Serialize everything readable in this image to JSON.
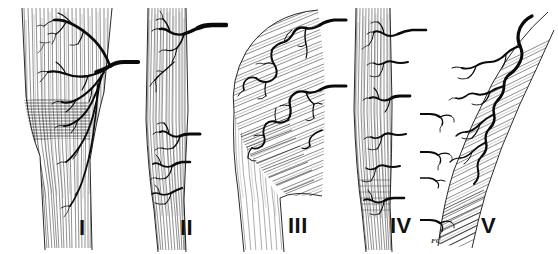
{
  "figure": {
    "medium": "pen-and-ink line drawing",
    "background_color": "#ffffff",
    "ink_color": "#111111",
    "width_px": 558,
    "height_px": 254,
    "panel_count": 5,
    "artist_signature": "FC"
  },
  "panels": [
    {
      "id": "panel-1",
      "label": "I",
      "subject": "muscle-with-single-dominant-vascular-pedicle",
      "description": "Tapering striated muscle belly with one large vascular trunk entering from the right and arborizing across the muscle",
      "vessel_entry_side": "right",
      "pedicle_count": 1,
      "striation_direction": "vertical"
    },
    {
      "id": "panel-2",
      "label": "II",
      "subject": "muscle-with-dominant-pedicle-and-minor-pedicles",
      "description": "Narrow striated muscle strip with one dominant vessel at the top and several smaller segmental branches below",
      "vessel_entry_side": "right",
      "pedicle_count": 4,
      "striation_direction": "vertical"
    },
    {
      "id": "panel-3",
      "label": "III",
      "subject": "muscle-with-two-dominant-pedicles",
      "description": "Broad cross-hatched muscle belly tapering to tendon, supplied by two large vessels entering from the right margin",
      "vessel_entry_side": "right",
      "pedicle_count": 2,
      "striation_direction": "oblique-hatched"
    },
    {
      "id": "panel-4",
      "label": "IV",
      "subject": "muscle-with-segmental-vascular-pedicles",
      "description": "Long strap muscle supplied by a row of equal-sized segmental vessels along its length",
      "vessel_entry_side": "right",
      "pedicle_count": 6,
      "striation_direction": "vertical"
    },
    {
      "id": "panel-5",
      "label": "V",
      "subject": "muscle-with-dominant-pedicle-and-secondary-segmental-pedicles",
      "description": "Fan-shaped cross-hatched muscle with one dominant vessel coursing along the lateral border and several secondary segmental vessels on the medial edge",
      "vessel_entry_side": "right-and-left",
      "pedicle_count": 5,
      "striation_direction": "fan-oblique"
    }
  ]
}
